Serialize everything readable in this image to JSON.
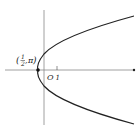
{
  "diagram": {
    "type": "polar-curve-parabola",
    "point_label": {
      "open": "(",
      "num": "1",
      "den": "2",
      "sep": ", ",
      "angle": "π",
      "close": ")"
    },
    "origin_label": "O",
    "tick_label": "1",
    "colors": {
      "curve": "#222222",
      "axis": "#888888",
      "point": "#111111"
    }
  }
}
